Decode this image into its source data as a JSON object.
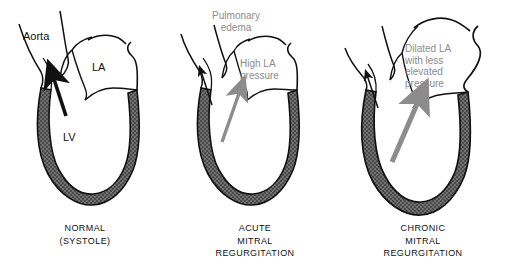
{
  "figure": {
    "title_visible": false,
    "background_color": "#ffffff",
    "ink_color": "#111111",
    "wall_fill_color": "#6e6e6e",
    "annotation_gray": "#8c8c8c",
    "arrow_gray": "#8c8c8c"
  },
  "panels": [
    {
      "id": "normal",
      "caption_lines": "NORMAL\n(SYSTOLE)",
      "labels": [
        {
          "name": "aorta-label",
          "text": "Aorta"
        },
        {
          "name": "la-label",
          "text": "LA"
        },
        {
          "name": "lv-label",
          "text": "LV"
        }
      ],
      "arrows": [
        {
          "name": "aortic-outflow-arrow",
          "color": "#111111",
          "style": "thick-black"
        }
      ]
    },
    {
      "id": "acute-mitral-regurgitation",
      "caption_lines": "ACUTE\nMITRAL\nREGURGITATION",
      "annotations": [
        {
          "name": "pulmonary-edema-annotation",
          "text": "Pulmonary\nedema"
        },
        {
          "name": "high-la-pressure-annotation",
          "text": "High LA\npressure"
        }
      ],
      "arrows": [
        {
          "name": "aortic-outflow-arrow",
          "color": "#111111",
          "style": "thin-black"
        },
        {
          "name": "regurgitant-jet-arrow",
          "color": "#8c8c8c",
          "style": "medium-gray"
        }
      ]
    },
    {
      "id": "chronic-mitral-regurgitation",
      "caption_lines": "CHRONIC\nMITRAL\nREGURGITATION",
      "annotations": [
        {
          "name": "dilated-la-annotation",
          "text": "Dilated LA\nwith less\nelevated\npressure"
        }
      ],
      "arrows": [
        {
          "name": "aortic-outflow-arrow",
          "color": "#111111",
          "style": "thin-black"
        },
        {
          "name": "regurgitant-jet-arrow",
          "color": "#8c8c8c",
          "style": "large-gray"
        }
      ]
    }
  ],
  "captions": {
    "panel1": "NORMAL\n(SYSTOLE)",
    "panel2": "ACUTE\nMITRAL\nREGURGITATION",
    "panel3": "CHRONIC\nMITRAL\nREGURGITATION"
  },
  "text": {
    "aorta": "Aorta",
    "la": "LA",
    "lv": "LV",
    "pulmonary_edema": "Pulmonary\nedema",
    "high_la_pressure": "High LA\npressure",
    "dilated_la": "Dilated LA\nwith less\nelevated\npressure"
  }
}
